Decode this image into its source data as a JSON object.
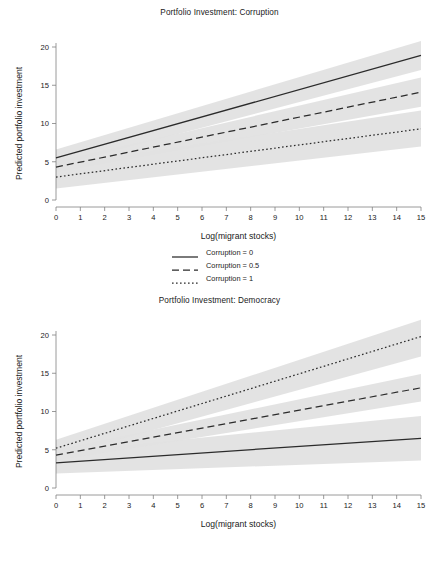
{
  "figure": {
    "background": "#ffffff",
    "line_color": "#2b2b2b",
    "band_color": "#e2e2e2",
    "axis_color": "#808080"
  },
  "panels": [
    {
      "id": "corruption",
      "title": "Portfolio Investment: Corruption",
      "legend": [
        {
          "label": "Corruption = 0",
          "style": "solid"
        },
        {
          "label": "Corruption = 0.5",
          "style": "dashed"
        },
        {
          "label": "Corruption = 1",
          "style": "dotted"
        }
      ]
    },
    {
      "id": "democracy",
      "title": "Portfolio Investment: Democracy",
      "legend": [
        {
          "label": "Democracy = 0",
          "style": "solid"
        },
        {
          "label": "Democracy = 0.5",
          "style": "dashed"
        },
        {
          "label": "Democracy = 1",
          "style": "dotted"
        }
      ]
    }
  ],
  "chart_data": [
    {
      "type": "line",
      "title": "Portfolio Investment: Corruption",
      "xlabel": "Log(migrant stocks)",
      "ylabel": "Predicted portfolio investment",
      "xlim": [
        0,
        15
      ],
      "ylim": [
        0,
        20
      ],
      "xticks": [
        0,
        1,
        2,
        3,
        4,
        5,
        6,
        7,
        8,
        9,
        10,
        11,
        12,
        13,
        14,
        15
      ],
      "yticks": [
        0,
        5,
        10,
        15,
        20
      ],
      "grid": false,
      "legend_position": "below",
      "series": [
        {
          "name": "Corruption = 0",
          "style": "solid",
          "x": [
            0,
            15
          ],
          "values": [
            5.5,
            18.9
          ],
          "ci_lower": [
            4.4,
            17.0
          ],
          "ci_upper": [
            6.6,
            20.8
          ]
        },
        {
          "name": "Corruption = 0.5",
          "style": "dashed",
          "x": [
            0,
            15
          ],
          "values": [
            4.3,
            14.1
          ],
          "ci_lower": [
            3.6,
            12.2
          ],
          "ci_upper": [
            5.0,
            16.0
          ]
        },
        {
          "name": "Corruption = 1",
          "style": "dotted",
          "x": [
            0,
            15
          ],
          "values": [
            3.0,
            9.3
          ],
          "ci_lower": [
            1.5,
            7.0
          ],
          "ci_upper": [
            4.5,
            11.7
          ]
        }
      ]
    },
    {
      "type": "line",
      "title": "Portfolio Investment: Democracy",
      "xlabel": "Log(migrant stocks)",
      "ylabel": "Predicted portfolio investment",
      "xlim": [
        0,
        15
      ],
      "ylim": [
        0,
        20
      ],
      "xticks": [
        0,
        1,
        2,
        3,
        4,
        5,
        6,
        7,
        8,
        9,
        10,
        11,
        12,
        13,
        14,
        15
      ],
      "yticks": [
        0,
        5,
        10,
        15,
        20
      ],
      "grid": false,
      "legend_position": "below",
      "series": [
        {
          "name": "Democracy = 0",
          "style": "solid",
          "x": [
            0,
            15
          ],
          "values": [
            3.3,
            6.5
          ],
          "ci_lower": [
            1.9,
            3.6
          ],
          "ci_upper": [
            4.7,
            9.4
          ]
        },
        {
          "name": "Democracy = 0.5",
          "style": "dashed",
          "x": [
            0,
            15
          ],
          "values": [
            4.3,
            13.1
          ],
          "ci_lower": [
            3.6,
            11.3
          ],
          "ci_upper": [
            5.0,
            14.9
          ]
        },
        {
          "name": "Democracy = 1",
          "style": "dotted",
          "x": [
            0,
            15
          ],
          "values": [
            5.2,
            19.8
          ],
          "ci_lower": [
            4.1,
            17.2
          ],
          "ci_upper": [
            6.3,
            22.0
          ]
        }
      ]
    }
  ]
}
